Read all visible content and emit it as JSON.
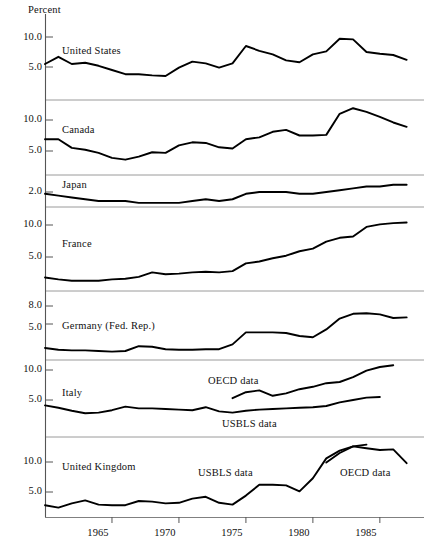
{
  "chart_data": {
    "type": "line",
    "title": "",
    "ylabel": "Percent",
    "xlabel": "",
    "grid": false,
    "legend_position": "inline-annotation",
    "axis_unit_label": "Percent",
    "x": [
      1960,
      1961,
      1962,
      1963,
      1964,
      1965,
      1966,
      1967,
      1968,
      1969,
      1970,
      1971,
      1972,
      1973,
      1974,
      1975,
      1976,
      1977,
      1978,
      1979,
      1980,
      1981,
      1982,
      1983,
      1984,
      1985,
      1986,
      1987
    ],
    "xticks": [
      1965,
      1970,
      1975,
      1980,
      1985
    ],
    "xtick_labels": [
      "1965",
      "1970",
      "1975",
      "1980",
      "1985"
    ],
    "panels": [
      {
        "name": "United States",
        "label": "United States",
        "yticks": [
          5.0,
          10.0
        ],
        "ytick_labels": [
          "5.0",
          "10.0"
        ],
        "ylim": [
          2.0,
          11.5
        ],
        "series": [
          {
            "name": "United States",
            "annotation": "",
            "x": [
              1960,
              1961,
              1962,
              1963,
              1964,
              1965,
              1966,
              1967,
              1968,
              1969,
              1970,
              1971,
              1972,
              1973,
              1974,
              1975,
              1976,
              1977,
              1978,
              1979,
              1980,
              1981,
              1982,
              1983,
              1984,
              1985,
              1986,
              1987
            ],
            "values": [
              5.5,
              6.7,
              5.5,
              5.7,
              5.2,
              4.5,
              3.8,
              3.8,
              3.6,
              3.5,
              4.9,
              5.9,
              5.6,
              4.9,
              5.6,
              8.5,
              7.7,
              7.1,
              6.1,
              5.8,
              7.1,
              7.6,
              9.7,
              9.6,
              7.5,
              7.2,
              7.0,
              6.2
            ]
          }
        ]
      },
      {
        "name": "Canada",
        "label": "Canada",
        "yticks": [
          5.0,
          10.0
        ],
        "ytick_labels": [
          "5.0",
          "10.0"
        ],
        "ylim": [
          2.0,
          13.0
        ],
        "series": [
          {
            "name": "Canada",
            "annotation": "",
            "x": [
              1960,
              1961,
              1962,
              1963,
              1964,
              1965,
              1966,
              1967,
              1968,
              1969,
              1970,
              1971,
              1972,
              1973,
              1974,
              1975,
              1976,
              1977,
              1978,
              1979,
              1980,
              1981,
              1982,
              1983,
              1984,
              1985,
              1986,
              1987
            ],
            "values": [
              6.9,
              6.9,
              5.5,
              5.2,
              4.7,
              3.9,
              3.6,
              4.1,
              4.8,
              4.7,
              5.9,
              6.4,
              6.3,
              5.6,
              5.4,
              6.9,
              7.2,
              8.1,
              8.4,
              7.5,
              7.5,
              7.6,
              11.0,
              11.9,
              11.3,
              10.5,
              9.6,
              8.9
            ]
          }
        ]
      },
      {
        "name": "Japan",
        "label": "Japan",
        "yticks": [
          2.0
        ],
        "ytick_labels": [
          "2.0"
        ],
        "ylim": [
          1.0,
          2.6
        ],
        "series": [
          {
            "name": "Japan",
            "annotation": "",
            "x": [
              1960,
              1961,
              1962,
              1963,
              1964,
              1965,
              1966,
              1967,
              1968,
              1969,
              1970,
              1971,
              1972,
              1973,
              1974,
              1975,
              1976,
              1977,
              1978,
              1979,
              1980,
              1981,
              1982,
              1983,
              1984,
              1985,
              1986,
              1987
            ],
            "values": [
              1.9,
              1.8,
              1.7,
              1.6,
              1.5,
              1.5,
              1.5,
              1.4,
              1.4,
              1.4,
              1.4,
              1.5,
              1.6,
              1.5,
              1.6,
              1.9,
              2.0,
              2.0,
              2.0,
              1.9,
              1.9,
              2.0,
              2.1,
              2.2,
              2.3,
              2.3,
              2.4,
              2.4
            ]
          }
        ]
      },
      {
        "name": "France",
        "label": "France",
        "yticks": [
          5.0,
          10.0
        ],
        "ytick_labels": [
          "5.0",
          "10.0"
        ],
        "ylim": [
          0.5,
          11.0
        ],
        "series": [
          {
            "name": "France",
            "annotation": "",
            "x": [
              1960,
              1961,
              1962,
              1963,
              1964,
              1965,
              1966,
              1967,
              1968,
              1969,
              1970,
              1971,
              1972,
              1973,
              1974,
              1975,
              1976,
              1977,
              1978,
              1979,
              1980,
              1981,
              1982,
              1983,
              1984,
              1985,
              1986,
              1987
            ],
            "values": [
              1.8,
              1.5,
              1.3,
              1.3,
              1.3,
              1.5,
              1.6,
              1.9,
              2.6,
              2.3,
              2.4,
              2.6,
              2.7,
              2.6,
              2.8,
              4.0,
              4.3,
              4.8,
              5.2,
              5.9,
              6.3,
              7.4,
              8.0,
              8.2,
              9.7,
              10.1,
              10.3,
              10.4
            ]
          }
        ]
      },
      {
        "name": "Germany (Fed. Rep.)",
        "label": "Germany (Fed. Rep.)",
        "yticks": [
          5.0,
          8.0
        ],
        "ytick_labels": [
          "5.0",
          "8.0"
        ],
        "ylim": [
          0.0,
          9.5
        ],
        "series": [
          {
            "name": "Germany (Fed. Rep.)",
            "annotation": "",
            "x": [
              1960,
              1961,
              1962,
              1963,
              1964,
              1965,
              1966,
              1967,
              1968,
              1969,
              1970,
              1971,
              1972,
              1973,
              1974,
              1975,
              1976,
              1977,
              1978,
              1979,
              1980,
              1981,
              1982,
              1983,
              1984,
              1985,
              1986,
              1987
            ],
            "values": [
              1.0,
              0.7,
              0.6,
              0.6,
              0.5,
              0.4,
              0.5,
              1.3,
              1.2,
              0.8,
              0.7,
              0.7,
              0.8,
              0.8,
              1.6,
              3.6,
              3.6,
              3.6,
              3.5,
              3.0,
              2.8,
              4.1,
              5.9,
              6.7,
              6.8,
              6.6,
              6.0,
              6.1
            ]
          }
        ]
      },
      {
        "name": "Italy",
        "label": "Italy",
        "yticks": [
          5.0,
          10.0
        ],
        "ytick_labels": [
          "5.0",
          "10.0"
        ],
        "ylim": [
          1.0,
          11.5
        ],
        "series": [
          {
            "name": "Italy OECD",
            "annotation": "OECD data",
            "x": [
              1974,
              1975,
              1976,
              1977,
              1978,
              1979,
              1980,
              1981,
              1982,
              1983,
              1984,
              1985,
              1986
            ],
            "values": [
              5.3,
              6.3,
              6.6,
              5.7,
              6.1,
              6.8,
              7.2,
              7.8,
              8.0,
              8.8,
              9.9,
              10.5,
              10.8
            ]
          },
          {
            "name": "Italy USBLS",
            "annotation": "USBLS data",
            "x": [
              1960,
              1961,
              1962,
              1963,
              1964,
              1965,
              1966,
              1967,
              1968,
              1969,
              1970,
              1971,
              1972,
              1973,
              1974,
              1975,
              1976,
              1977,
              1978,
              1979,
              1980,
              1981,
              1982,
              1983,
              1984,
              1985
            ],
            "values": [
              4.1,
              3.7,
              3.2,
              2.8,
              2.9,
              3.3,
              3.9,
              3.6,
              3.6,
              3.5,
              3.4,
              3.3,
              3.8,
              3.1,
              2.9,
              3.2,
              3.4,
              3.5,
              3.6,
              3.7,
              3.8,
              4.0,
              4.6,
              5.0,
              5.4,
              5.5
            ]
          }
        ]
      },
      {
        "name": "United Kingdom",
        "label": "United Kingdom",
        "yticks": [
          5.0,
          10.0
        ],
        "ytick_labels": [
          "5.0",
          "10.0"
        ],
        "ylim": [
          1.0,
          13.5
        ],
        "series": [
          {
            "name": "United Kingdom USBLS",
            "annotation": "USBLS data",
            "x": [
              1960,
              1961,
              1962,
              1963,
              1964,
              1965,
              1966,
              1967,
              1968,
              1969,
              1970,
              1971,
              1972,
              1973,
              1974,
              1975,
              1976,
              1977,
              1978,
              1979,
              1980,
              1981,
              1982,
              1983,
              1984
            ],
            "values": [
              2.8,
              2.4,
              3.1,
              3.6,
              2.9,
              2.8,
              2.8,
              3.5,
              3.4,
              3.1,
              3.2,
              3.9,
              4.2,
              3.2,
              2.9,
              4.4,
              6.2,
              6.2,
              6.1,
              5.1,
              7.3,
              10.6,
              11.9,
              12.6,
              12.9
            ]
          },
          {
            "name": "United Kingdom OECD",
            "annotation": "OECD data",
            "x": [
              1981,
              1982,
              1983,
              1984,
              1985,
              1986,
              1987
            ],
            "values": [
              9.9,
              11.5,
              12.6,
              12.3,
              12.0,
              12.1,
              9.8
            ]
          }
        ]
      }
    ]
  },
  "panel_labels": {
    "us": "United States",
    "canada": "Canada",
    "japan": "Japan",
    "france": "France",
    "germany": "Germany (Fed. Rep.)",
    "italy": "Italy",
    "uk": "United Kingdom"
  },
  "annotations": {
    "italy_oecd": "OECD data",
    "italy_usbls": "USBLS data",
    "uk_usbls": "USBLS data",
    "uk_oecd": "OECD data"
  },
  "axis": {
    "unit": "Percent",
    "xticks": [
      "1965",
      "1970",
      "1975",
      "1980",
      "1985"
    ]
  },
  "ylabels": {
    "us": [
      "10.0",
      "5.0"
    ],
    "canada": [
      "10.0",
      "5.0"
    ],
    "japan": [
      "2.0"
    ],
    "france": [
      "10.0",
      "5.0"
    ],
    "germany": [
      "8.0",
      "5.0"
    ],
    "italy": [
      "10.0",
      "5.0"
    ],
    "uk": [
      "10.0",
      "5.0"
    ]
  },
  "colors": {
    "line": "#000000",
    "separator": "#808080",
    "axis": "#555555",
    "background": "#ffffff"
  }
}
